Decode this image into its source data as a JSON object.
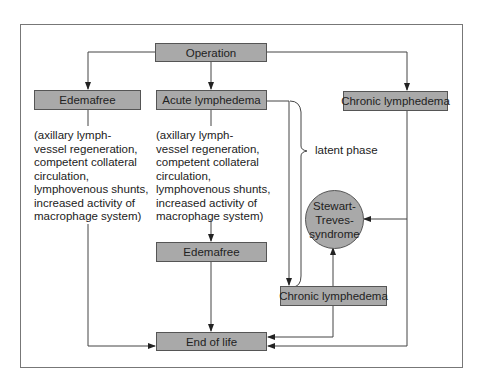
{
  "diagram": {
    "nodes": {
      "operation": "Operation",
      "edemafree_top": "Edemafree",
      "acute": "Acute lymphedema",
      "chronic_top": "Chronic lymphedema",
      "edemafree_mid": "Edemafree",
      "chronic_lower": "Chronic lymphedema",
      "stewart": "Stewart-\nTreves-\nsyndrome",
      "end": "End of life"
    },
    "notes": {
      "left": "(axillary lymph-\nvessel regeneration,\ncompetent collateral\ncirculation,\nlymphovenous shunts,\nincreased activity of\nmacrophage system)",
      "middle": "(axillary lymph-\nvessel regeneration,\ncompetent collateral\ncirculation,\nlymphovenous shunts,\nincreased activity of\nmacrophage system)"
    },
    "brace_label": "latent phase",
    "colors": {
      "box_fill": "#a9a9a9",
      "line": "#444444"
    }
  }
}
